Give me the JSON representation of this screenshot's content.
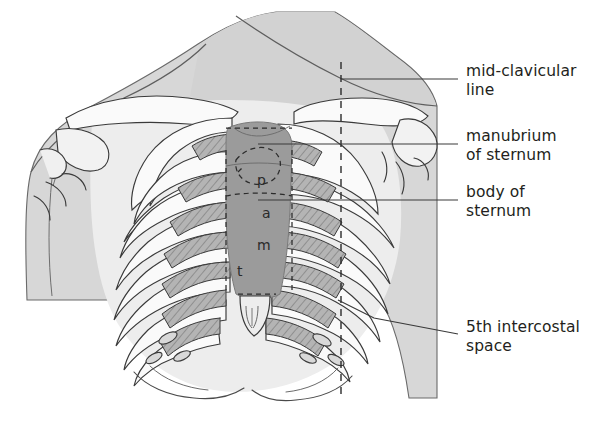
{
  "figure": {
    "colors": {
      "background": "#ffffff",
      "body_fill": "#d7d7d7",
      "body_fill_light": "#e3e3e3",
      "sternum_fill": "#9b9b9b",
      "rib_fill": "#f7f7f7",
      "cartilage_fill": "#a9a9a9",
      "outline": "#3a3a3a",
      "label_text": "#231f20",
      "leader_line": "#3a3a3a",
      "dashed_line": "#2b2b2b"
    }
  },
  "labels": [
    {
      "id": "mid-clavicular-line",
      "text": "mid-clavicular\nline",
      "x": 466,
      "y": 62,
      "leader": {
        "x1": 341,
        "y1": 79,
        "x2": 458,
        "y2": 79
      }
    },
    {
      "id": "manubrium-of-sternum",
      "text": "manubrium\nof sternum",
      "x": 466,
      "y": 127,
      "leader": {
        "x1": 258,
        "y1": 144,
        "x2": 458,
        "y2": 144
      }
    },
    {
      "id": "body-of-sternum",
      "text": "body of\nsternum",
      "x": 466,
      "y": 183,
      "leader": {
        "x1": 258,
        "y1": 200,
        "x2": 458,
        "y2": 200
      }
    },
    {
      "id": "5th-intercostal-space",
      "text": "5th intercostal\nspace",
      "x": 466,
      "y": 318,
      "leader_polyline": "338,300 374,318 458,334"
    }
  ],
  "auscultation_points": [
    {
      "id": "pulmonary",
      "letter": "p",
      "x": 257,
      "y": 180
    },
    {
      "id": "aortic",
      "letter": "a",
      "x": 262,
      "y": 213
    },
    {
      "id": "mitral",
      "letter": "m",
      "x": 258,
      "y": 245
    },
    {
      "id": "tricuspid",
      "letter": "t",
      "x": 237,
      "y": 271
    }
  ],
  "dashed_lines": [
    {
      "id": "mid-clavicular-line-right",
      "x": 341,
      "y1": 62,
      "y2": 398
    },
    {
      "id": "sternum-border-outline",
      "note": "dashed outline around sternum and cardiac area"
    }
  ]
}
